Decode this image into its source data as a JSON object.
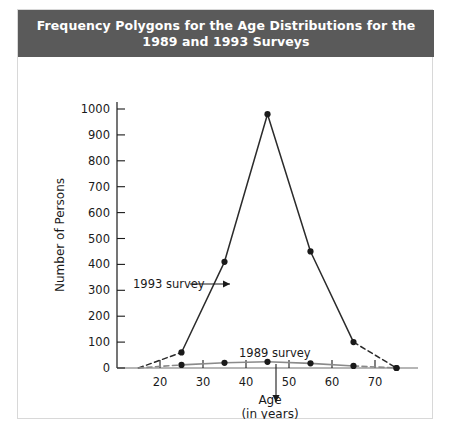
{
  "figure": {
    "title_line1": "Frequency Polygons for the Age Distributions for the",
    "title_line2": "1989 and 1993 Surveys",
    "title_bg": "#5a5a5a",
    "title_color": "#ffffff",
    "border_color": "#d8d8d8"
  },
  "chart_data": {
    "type": "line",
    "title": "Frequency Polygons for the Age Distributions for the 1989 and 1993 Surveys",
    "xlabel": "Age",
    "xlabel_sub": "(in years)",
    "ylabel": "Number of Persons",
    "x": [
      15,
      25,
      35,
      45,
      55,
      65,
      75
    ],
    "xlim": [
      10,
      80
    ],
    "ylim": [
      0,
      1000
    ],
    "xticks": [
      20,
      30,
      40,
      50,
      60,
      70
    ],
    "xticklabels": [
      "20",
      "30",
      "40",
      "50",
      "60",
      "70"
    ],
    "yticks": [
      0,
      100,
      200,
      300,
      400,
      500,
      600,
      700,
      800,
      900,
      1000
    ],
    "yticklabels": [
      "0",
      "100",
      "200",
      "300",
      "400",
      "500",
      "600",
      "700",
      "800",
      "900",
      "1000"
    ],
    "grid": false,
    "legend_position": "inline-annotations",
    "series": [
      {
        "name": "1993 survey",
        "color": "#2b2b2b",
        "values": [
          0,
          60,
          410,
          980,
          450,
          100,
          0
        ],
        "dashed_segments": [
          [
            15,
            25
          ],
          [
            65,
            75
          ]
        ],
        "marker": "filled-circle"
      },
      {
        "name": "1989 survey",
        "color": "#8a8a8a",
        "values": [
          0,
          12,
          20,
          24,
          18,
          8,
          0
        ],
        "dashed_segments": [
          [
            15,
            25
          ],
          [
            65,
            75
          ]
        ],
        "marker": "filled-circle"
      }
    ],
    "annotations": [
      {
        "label": "1993 survey",
        "text_x": 115,
        "text_y": 231,
        "arrow_from_x": 172,
        "arrow_from_y": 227,
        "arrow_to_x": 212,
        "arrow_to_y": 227,
        "direction": "right"
      },
      {
        "label": "1989 survey",
        "text_x": 221,
        "text_y": 300,
        "arrow_from_x": 258,
        "arrow_from_y": 307,
        "arrow_to_x": 258,
        "arrow_to_y": 345,
        "direction": "down"
      }
    ]
  }
}
